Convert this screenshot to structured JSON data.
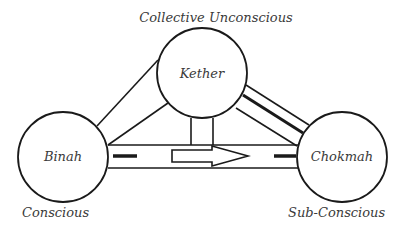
{
  "diagram": {
    "type": "triangle-relationship",
    "colors": {
      "stroke": "#1a1a1a",
      "text": "#3a3a3a",
      "background": "#ffffff"
    },
    "nodes": [
      {
        "id": "kether",
        "label": "Kether",
        "caption": "Collective Unconscious",
        "position": "top"
      },
      {
        "id": "binah",
        "label": "Binah",
        "caption": "Conscious",
        "position": "bottom-left"
      },
      {
        "id": "chokmah",
        "label": "Chokmah",
        "caption": "Sub-Conscious",
        "position": "bottom-right"
      }
    ],
    "edges": [
      {
        "from": "kether",
        "to": "binah",
        "style": "double-line"
      },
      {
        "from": "kether",
        "to": "chokmah",
        "style": "double-line-with-bold-inner"
      },
      {
        "from": "kether",
        "to": "binah-chokmah-path",
        "style": "vertical-double-line"
      },
      {
        "from": "binah",
        "to": "chokmah",
        "style": "double-line-with-dashes-and-arrow",
        "arrow_direction": "right"
      }
    ]
  }
}
